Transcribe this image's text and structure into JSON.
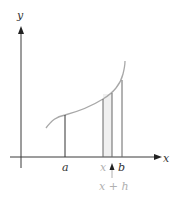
{
  "diagram": {
    "axes": {
      "x_label": "x",
      "y_label": "y"
    },
    "ticks": {
      "a": "a",
      "x": "x",
      "b": "b",
      "x_plus_h": "x + h"
    },
    "colors": {
      "axis": "#3a3a3a",
      "curve": "#a8a8a8",
      "strip_fill": "#f0f0f0",
      "muted_label": "#b0b0b0",
      "label": "#333333"
    }
  }
}
